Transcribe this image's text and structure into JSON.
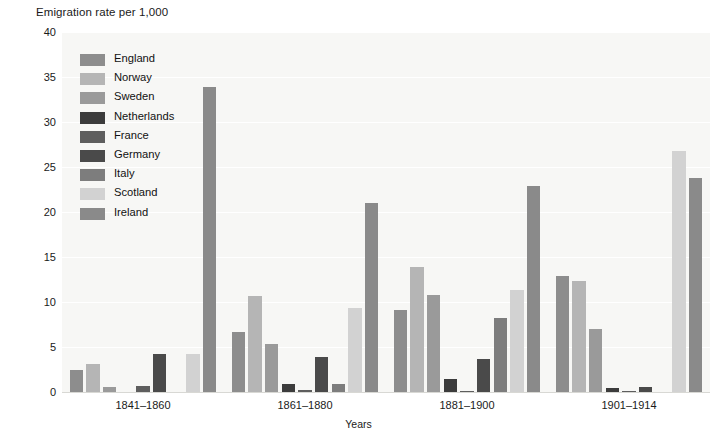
{
  "chart_data": {
    "type": "bar",
    "title": "Emigration rate per 1,000",
    "xlabel": "Years",
    "ylabel": "",
    "ylim": [
      0,
      40
    ],
    "yticks": [
      0,
      5,
      10,
      15,
      20,
      25,
      30,
      35,
      40
    ],
    "grid": true,
    "legend_position": "inside-top-left",
    "categories": [
      "1841–1860",
      "1861–1880",
      "1881–1900",
      "1901–1914"
    ],
    "series": [
      {
        "name": "England",
        "color": "#8d8d8d",
        "values": [
          2.4,
          6.7,
          9.1,
          12.9
        ]
      },
      {
        "name": "Norway",
        "color": "#b5b5b5",
        "values": [
          3.1,
          10.7,
          13.9,
          12.3
        ]
      },
      {
        "name": "Sweden",
        "color": "#9a9a9a",
        "values": [
          0.6,
          5.3,
          10.8,
          7.0
        ]
      },
      {
        "name": "Netherlands",
        "color": "#3c3c3c",
        "values": [
          0.0,
          0.9,
          1.4,
          0.5
        ]
      },
      {
        "name": "France",
        "color": "#5e5e5e",
        "values": [
          0.7,
          0.2,
          0.1,
          0.1
        ]
      },
      {
        "name": "Germany",
        "color": "#4a4a4a",
        "values": [
          4.2,
          3.9,
          3.7,
          0.6
        ]
      },
      {
        "name": "Italy",
        "color": "#7d7d7d",
        "values": [
          0.0,
          0.9,
          8.2,
          0.0
        ]
      },
      {
        "name": "Scotland",
        "color": "#d2d2d2",
        "values": [
          4.2,
          9.3,
          11.3,
          26.8
        ]
      },
      {
        "name": "Ireland",
        "color": "#8a8a8a",
        "values": [
          33.9,
          21.0,
          22.9,
          23.8
        ]
      }
    ]
  },
  "legend": {
    "items": [
      {
        "label": "England"
      },
      {
        "label": "Norway"
      },
      {
        "label": "Sweden"
      },
      {
        "label": "Netherlands"
      },
      {
        "label": "France"
      },
      {
        "label": "Germany"
      },
      {
        "label": "Italy"
      },
      {
        "label": "Scotland"
      },
      {
        "label": "Ireland"
      }
    ]
  },
  "axes": {
    "y_tick_labels": [
      "40",
      "35",
      "30",
      "25",
      "20",
      "15",
      "10",
      "5",
      "0"
    ],
    "x_tick_labels": [
      "1841–1860",
      "1861–1880",
      "1881–1900",
      "1901–1914"
    ],
    "x_axis_title": "Years"
  },
  "colors": {
    "plot_background": "#f7f7f5",
    "gridline": "#ffffff",
    "text": "#111111"
  }
}
